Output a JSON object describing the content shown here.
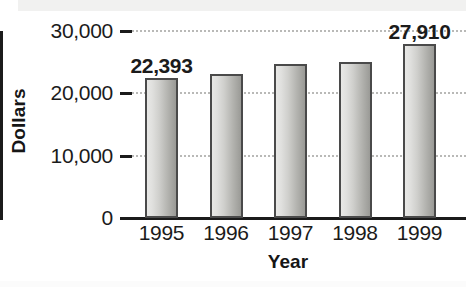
{
  "chart_data": {
    "type": "bar",
    "title": "",
    "xlabel": "Year",
    "ylabel": "Dollars",
    "categories": [
      "1995",
      "1996",
      "1997",
      "1998",
      "1999"
    ],
    "values": [
      22393,
      23100,
      24700,
      25000,
      27910
    ],
    "value_labels": [
      "22,393",
      "",
      "",
      "",
      "27,910"
    ],
    "ylim": [
      0,
      30000
    ],
    "ytick_values": [
      0,
      10000,
      20000,
      30000
    ],
    "ytick_labels": [
      "0",
      "10,000",
      "20,000",
      "30,000"
    ],
    "grid": true,
    "grid_style": "dotted",
    "legend": null,
    "bar_fill_light": "#e8e8e6",
    "bar_fill_dark": "#9a9a96",
    "bar_outline": "#4a4a4a",
    "text_color": "#1b1b1b",
    "background": "#ffffff"
  },
  "axes": {
    "y_title": "Dollars",
    "x_title": "Year"
  },
  "y_ticks": [
    {
      "label": "30,000",
      "value": 30000
    },
    {
      "label": "20,000",
      "value": 20000
    },
    {
      "label": "10,000",
      "value": 10000
    },
    {
      "label": "0",
      "value": 0
    }
  ],
  "bars": [
    {
      "category": "1995",
      "value": 22393,
      "label": "22,393"
    },
    {
      "category": "1996",
      "value": 23100,
      "label": ""
    },
    {
      "category": "1997",
      "value": 24700,
      "label": ""
    },
    {
      "category": "1998",
      "value": 25000,
      "label": ""
    },
    {
      "category": "1999",
      "value": 27910,
      "label": "27,910"
    }
  ]
}
